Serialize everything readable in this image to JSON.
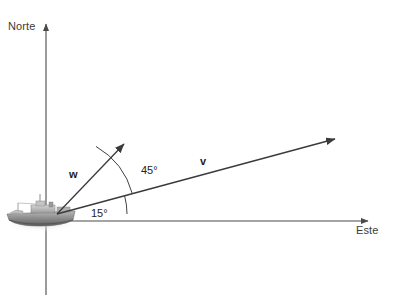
{
  "figure": {
    "background_color": "#ffffff",
    "axis_color": "#4a4a4a",
    "vector_color": "#3a3a3a",
    "arc_color": "#2b2b2b",
    "text_color": "#2b2b2b",
    "width": 393,
    "height": 302
  },
  "axes": {
    "vertical": {
      "label": "Norte",
      "direction": "up",
      "arrow_at": "top",
      "x": 46,
      "y_top": 22,
      "y_bottom": 295
    },
    "horizontal": {
      "label": "Este",
      "direction": "right",
      "arrow_at": "right",
      "y": 221,
      "x_left": 46,
      "x_right": 372
    }
  },
  "origin": {
    "x": 57,
    "y": 214
  },
  "ship": {
    "icon_name": "ship-icon",
    "description": "Buque visto de perfil en escala de grises",
    "x": 5,
    "y": 198,
    "width": 72,
    "height": 34
  },
  "vectors": [
    {
      "name": "w",
      "label": "w",
      "tip_x": 127,
      "tip_y": 141,
      "bearing_from_east_deg": 60
    },
    {
      "name": "v",
      "label": "v",
      "tip_x": 341,
      "tip_y": 137,
      "bearing_from_east_deg": 15
    }
  ],
  "angles": [
    {
      "name": "angle-between-w-and-v",
      "label": "45°",
      "value": 45,
      "unit": "degrees",
      "from": "v",
      "to": "w",
      "arc_radius": 78
    },
    {
      "name": "angle-between-v-and-east",
      "label": "15°",
      "value": 15,
      "unit": "degrees",
      "from": "Este",
      "to": "v",
      "arc_radius": 70
    }
  ]
}
